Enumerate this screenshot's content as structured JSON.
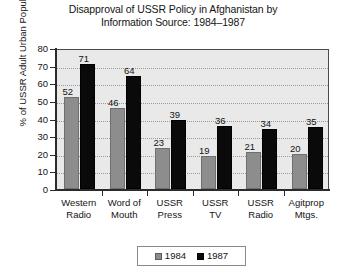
{
  "chart_data": {
    "type": "bar",
    "title": "Disapproval of USSR Policy in Afghanistan by Information Source: 1984–1987",
    "title_line1": "Disapproval of USSR Policy in Afghanistan by",
    "title_line2": "Information Source: 1984–1987",
    "xlabel": "",
    "ylabel": "% of USSR Adult Urban Population",
    "ylim": [
      0,
      80
    ],
    "ytick_step": 10,
    "yticks": [
      "0",
      "10",
      "20",
      "30",
      "40",
      "50",
      "60",
      "70",
      "80"
    ],
    "grid": true,
    "legend_position": "bottom-center",
    "categories": [
      "Western Radio",
      "Word of Mouth",
      "USSR Press",
      "USSR TV",
      "USSR Radio",
      "Agitprop Mtgs."
    ],
    "category_lines": [
      [
        "Western",
        "Radio"
      ],
      [
        "Word of",
        "Mouth"
      ],
      [
        "USSR",
        "Press"
      ],
      [
        "USSR",
        "TV"
      ],
      [
        "USSR",
        "Radio"
      ],
      [
        "Agitprop",
        "Mtgs."
      ]
    ],
    "series": [
      {
        "name": "1984",
        "color": "#8d8d8d",
        "values": [
          52,
          46,
          23,
          19,
          21,
          20
        ]
      },
      {
        "name": "1987",
        "color": "#0a0a0a",
        "values": [
          71,
          64,
          39,
          36,
          34,
          35
        ]
      }
    ]
  },
  "legend": {
    "entries": [
      {
        "label": "1984",
        "swatch": "gray-swatch"
      },
      {
        "label": "1987",
        "swatch": "black-swatch"
      }
    ]
  }
}
